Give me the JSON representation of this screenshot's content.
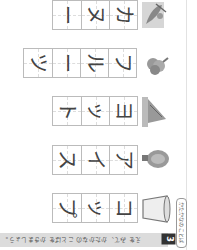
{
  "worksheet": {
    "orientation": "rotated 90deg",
    "section_number": "3",
    "instruction": "えを みて、かたかなの ことばを かきましょう。",
    "side_tab_label": "かたかなの ことば"
  },
  "rows": [
    {
      "picture": "canoe",
      "word": "カヌー",
      "chars": [
        "カ",
        "ヌ",
        "ー"
      ]
    },
    {
      "picture": "grapes-fruit",
      "word": "フルーツ",
      "chars": [
        "フ",
        "ル",
        "ー",
        "ツ"
      ]
    },
    {
      "picture": "yacht",
      "word": "ヨット",
      "chars": [
        "ヨ",
        "ッ",
        "ト"
      ]
    },
    {
      "picture": "ice-cream-cone",
      "word": "アイス",
      "chars": [
        "ア",
        "イ",
        "ス"
      ]
    },
    {
      "picture": "cup",
      "word": "コップ",
      "chars": [
        "コ",
        "ッ",
        "プ"
      ]
    }
  ]
}
